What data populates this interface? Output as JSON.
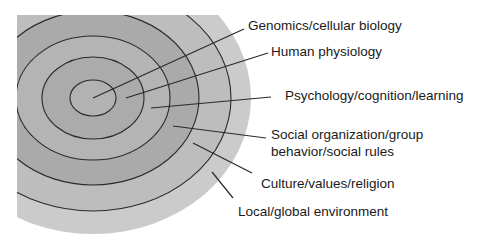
{
  "diagram": {
    "type": "concentric-rings",
    "center": {
      "x": 93,
      "y": 98
    },
    "layers": [
      {
        "id": "genomics",
        "label": "Genomics/cellular biology",
        "order": 1
      },
      {
        "id": "physiology",
        "label": "Human physiology",
        "order": 2
      },
      {
        "id": "psychology",
        "label": "Psychology/cognition/learning",
        "order": 3
      },
      {
        "id": "social",
        "label_line1": "Social organization/group",
        "label_line2": "behavior/social rules",
        "order": 4
      },
      {
        "id": "culture",
        "label": "Culture/values/religion",
        "order": 5
      },
      {
        "id": "environment",
        "label": "Local/global environment",
        "order": 6
      }
    ],
    "colors": {
      "outer_region": "#cbcbcb",
      "ring5_band": "#bdbdbd",
      "ring4_band": "#aaaaaa",
      "ring3_band": "#b4b4b4",
      "ring2_band": "#ababab",
      "ring1_core": "#b2b2b2",
      "outline": "#2a2a2a",
      "text": "#1a1a1a"
    }
  }
}
